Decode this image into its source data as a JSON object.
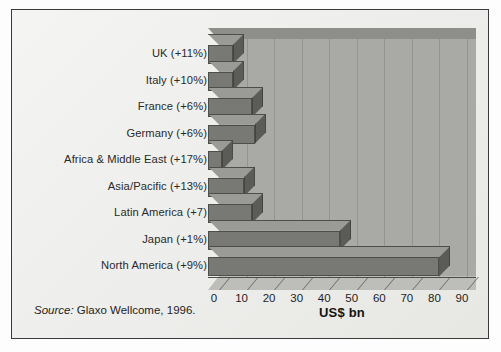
{
  "chart_data": {
    "type": "bar",
    "orientation": "horizontal",
    "title": "",
    "xlabel": "US$ bn",
    "ylabel": "",
    "xlim": [
      0,
      90
    ],
    "xticks": [
      0,
      10,
      20,
      30,
      40,
      50,
      60,
      70,
      80,
      90
    ],
    "grid": true,
    "legend": false,
    "style": "3d-bar",
    "categories": [
      "UK (+11%)",
      "Italy (+10%)",
      "France (+6%)",
      "Germany (+6%)",
      "Africa & Middle East (+17%)",
      "Asia/Pacific (+13%)",
      "Latin America (+7)",
      "Japan (+1%)",
      "North America (+9%)"
    ],
    "values": [
      9,
      9,
      16,
      17,
      5,
      13,
      16,
      48,
      84
    ],
    "growth_rates": [
      "+11%",
      "+10%",
      "+6%",
      "+6%",
      "+17%",
      "+13%",
      "+7",
      "+1%",
      "+9%"
    ],
    "region_names": [
      "UK",
      "Italy",
      "France",
      "Germany",
      "Africa & Middle East",
      "Asia/Pacific",
      "Latin America",
      "Japan",
      "North America"
    ],
    "source_note": "Source: Glaxo Wellcome, 1996.",
    "source_prefix": "Source:",
    "source_body": " Glaxo Wellcome, 1996.",
    "colors": {
      "bar_front": "#787874",
      "bar_top": "#9a9a96",
      "bar_side": "#5b5b58",
      "wall": "#a9a9a6",
      "floor": "#bdbdb9",
      "background": "#eeeeec",
      "text": "#1e1e1e",
      "frame": "#3a3a3a"
    }
  }
}
